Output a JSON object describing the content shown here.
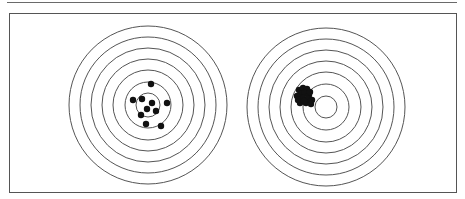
{
  "figure": {
    "colors": {
      "background": "#ffffff",
      "ring_stroke": "#555555",
      "frame_stroke": "#555555",
      "dot_fill": "#111111"
    },
    "targets": [
      {
        "id": "left",
        "label": "scattered-grouping-target",
        "center": [
          148,
          105
        ],
        "ring_radii": [
          79,
          68,
          57,
          46,
          35,
          23,
          12
        ],
        "dot_radius": 3.2,
        "shots": [
          [
            151,
            84
          ],
          [
            133,
            100
          ],
          [
            142,
            99
          ],
          [
            152,
            103
          ],
          [
            167,
            103
          ],
          [
            147,
            109
          ],
          [
            156,
            111
          ],
          [
            141,
            115
          ],
          [
            146,
            124
          ],
          [
            161,
            126
          ]
        ]
      },
      {
        "id": "right",
        "label": "tight-offset-grouping-target",
        "center": [
          326,
          107
        ],
        "ring_radii": [
          79,
          68,
          57,
          46,
          35,
          23,
          11
        ],
        "dot_radius": 3.2,
        "shots": [
          [
            299,
            90
          ],
          [
            303,
            88
          ],
          [
            307,
            89
          ],
          [
            301,
            94
          ],
          [
            305,
            93
          ],
          [
            309,
            95
          ],
          [
            297,
            96
          ],
          [
            303,
            98
          ],
          [
            308,
            99
          ],
          [
            312,
            100
          ],
          [
            300,
            103
          ],
          [
            306,
            103
          ],
          [
            311,
            104
          ],
          [
            298,
            100
          ],
          [
            304,
            101
          ],
          [
            310,
            92
          ]
        ]
      }
    ]
  }
}
